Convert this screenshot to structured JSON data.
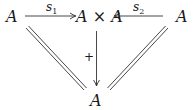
{
  "diagram": {
    "nodes": {
      "left": "A",
      "center": "A × A",
      "right": "A",
      "bottom": "A"
    },
    "arrows": {
      "s1": {
        "label": "s",
        "sub": "1",
        "from": "left",
        "to": "center"
      },
      "s2": {
        "label": "s",
        "sub": "2",
        "from": "right",
        "to": "center"
      },
      "plus": {
        "label": "+",
        "from": "center",
        "to": "bottom"
      }
    },
    "equalities": [
      "left = bottom",
      "right = bottom"
    ],
    "colors": {
      "stroke": "#1a1a1a",
      "background": "#ffffff"
    }
  }
}
